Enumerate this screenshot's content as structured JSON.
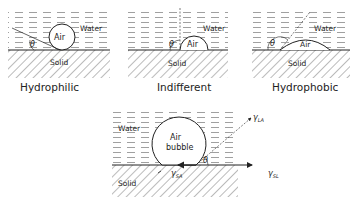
{
  "panels": [
    {
      "id": "hydrophilic",
      "caption": "Hydrophilic",
      "gas": "Air",
      "liquid": "Water",
      "solid": "Solid",
      "angle": "θ"
    },
    {
      "id": "indifferent",
      "caption": "Indifferent",
      "gas": "Air",
      "liquid": "Water",
      "solid": "Solid",
      "angle": "θ"
    },
    {
      "id": "hydrophobic",
      "caption": "Hydrophobic",
      "gas": "Air",
      "liquid": "Water",
      "solid": "Solid",
      "angle": "θ"
    }
  ],
  "bubble": {
    "gas_line1": "Air",
    "gas_line2": "bubble",
    "liquid": "Water",
    "solid": "Solid",
    "angle": "θ",
    "gamma": "γ",
    "sub_la": "LA",
    "sub_sa": "SA",
    "sub_sl": "SL"
  },
  "colors": {
    "ink": "#222222",
    "hatch": "#555555",
    "water_dash": "#666666",
    "background": "#ffffff"
  }
}
